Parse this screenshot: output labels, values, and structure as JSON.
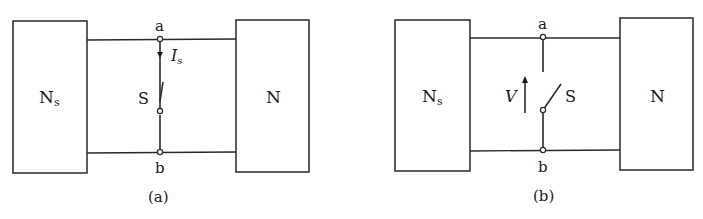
{
  "figure": {
    "panels": [
      {
        "id": "a",
        "caption": "(a)",
        "left_box": {
          "label": "N",
          "subscript": "s"
        },
        "right_box": {
          "label": "N"
        },
        "top_node": "a",
        "bottom_node": "b",
        "switch_label": "S",
        "switch_state": "closed",
        "current_label": "I",
        "current_subscript": "s",
        "current_direction": "a-to-b (downward)"
      },
      {
        "id": "b",
        "caption": "(b)",
        "left_box": {
          "label": "N",
          "subscript": "s"
        },
        "right_box": {
          "label": "N"
        },
        "top_node": "a",
        "bottom_node": "b",
        "switch_label": "S",
        "switch_state": "open",
        "voltage_label": "V",
        "voltage_direction": "upward arrow"
      }
    ],
    "colors": {
      "line": "#2a2a2a",
      "background": "#ffffff"
    }
  }
}
